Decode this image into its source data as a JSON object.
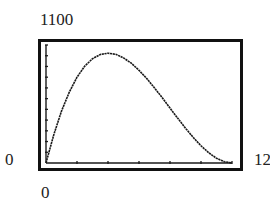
{
  "labels": {
    "y_max": "1100",
    "y_min": "0",
    "x_min": "0",
    "x_max": "12"
  },
  "chart_data": {
    "type": "line",
    "title": "",
    "xlabel": "",
    "ylabel": "",
    "xlim": [
      0,
      12
    ],
    "ylim": [
      0,
      1100
    ],
    "x_tick_step": 2,
    "y_tick_step": 100,
    "grid": false,
    "legend": null,
    "series": [
      {
        "name": "f(x)",
        "x": [
          0,
          0.5,
          1,
          1.5,
          2,
          2.5,
          3,
          3.5,
          4,
          4.5,
          5,
          5.5,
          6,
          6.5,
          7,
          7.5,
          8,
          8.5,
          9,
          9.5,
          10,
          10.5,
          11,
          11.5,
          12
        ],
        "y": [
          0,
          264,
          484,
          661,
          800,
          903,
          972,
          1011,
          1024,
          1013,
          980,
          930,
          864,
          787,
          700,
          608,
          512,
          417,
          324,
          238,
          160,
          95,
          44,
          12,
          0
        ]
      }
    ],
    "color": "#1a1a1a",
    "background": "#ffffff"
  }
}
